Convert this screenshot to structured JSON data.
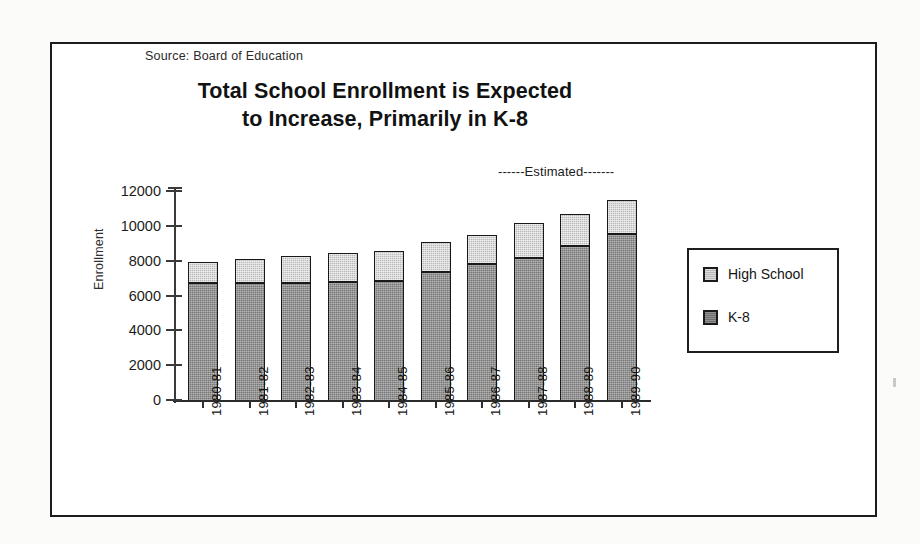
{
  "source_note": "Source:  Board of Education",
  "title": {
    "line1": "Total School Enrollment is Expected",
    "line2": "to Increase, Primarily in K-8"
  },
  "estimated_note": "------Estimated-------",
  "legend": {
    "items": [
      {
        "label": "High School",
        "color": "#b9b9b9"
      },
      {
        "label": "K-8",
        "color": "#6e6e6e"
      }
    ]
  },
  "colors": {
    "high_school": "#b9b9b9",
    "k8": "#6e6e6e",
    "outline": "#191919",
    "frame": "#1b1b1b"
  },
  "chart_data": {
    "type": "bar",
    "stacked": true,
    "title": "Total School Enrollment is Expected to Increase, Primarily in K-8",
    "subtitle": "Source:  Board of Education",
    "xlabel": "",
    "ylabel": "Enrollment",
    "ylim": [
      0,
      12000
    ],
    "yticks": [
      0,
      2000,
      4000,
      6000,
      8000,
      10000,
      12000
    ],
    "ytick_labels": [
      "0",
      "2000",
      "4000",
      "6000",
      "8000",
      "10000",
      "12000"
    ],
    "grid": false,
    "legend_position": "right",
    "categories": [
      "1980-81",
      "1981-82",
      "1982-83",
      "1983-84",
      "1984-85",
      "1985-86",
      "1986-87",
      "1987-88",
      "1988-89",
      "1989-90"
    ],
    "series": [
      {
        "name": "K-8",
        "color": "#6e6e6e",
        "values": [
          6650,
          6650,
          6650,
          6700,
          6800,
          7300,
          7750,
          8100,
          8800,
          9500
        ]
      },
      {
        "name": "High School",
        "color": "#b9b9b9",
        "values": [
          1300,
          1450,
          1600,
          1750,
          1750,
          1800,
          1750,
          2050,
          1900,
          2000
        ]
      }
    ],
    "totals": [
      7950,
      8100,
      8250,
      8450,
      8550,
      9100,
      9500,
      10150,
      10700,
      11500
    ],
    "annotations": [
      {
        "text": "------Estimated-------",
        "applies_to": [
          "1987-88",
          "1988-89",
          "1989-90"
        ]
      }
    ]
  }
}
